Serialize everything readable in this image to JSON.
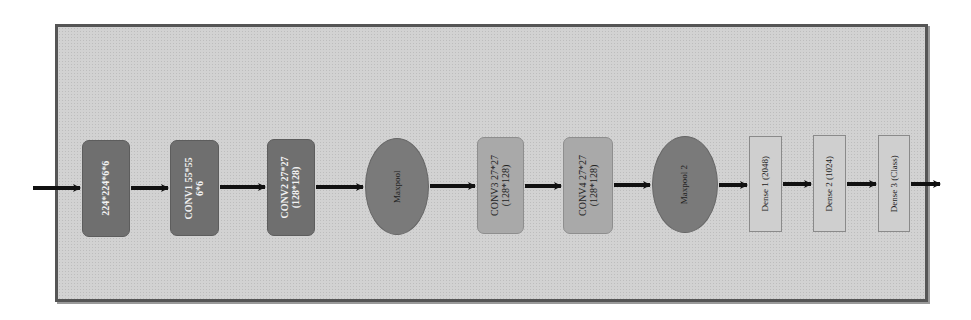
{
  "diagram": {
    "type": "cnn-architecture-flow",
    "nodes": [
      {
        "id": "input",
        "lines": [
          "224*224*6*6"
        ],
        "shape": "rounded-rect",
        "fill": "#6f6f6f"
      },
      {
        "id": "conv1",
        "lines": [
          "CONV1 55*55",
          "6*6"
        ],
        "shape": "rounded-rect",
        "fill": "#6f6f6f"
      },
      {
        "id": "conv2",
        "lines": [
          "CONV2 27*27",
          "(128*128)"
        ],
        "shape": "rounded-rect",
        "fill": "#6f6f6f"
      },
      {
        "id": "maxpool",
        "lines": [
          "Maxpool"
        ],
        "shape": "ellipse",
        "fill": "#7a7a7a"
      },
      {
        "id": "conv3",
        "lines": [
          "CONV3 27*27",
          "(128*128)"
        ],
        "shape": "rounded-rect",
        "fill": "#a9a9a9"
      },
      {
        "id": "conv4",
        "lines": [
          "CONV4 27*27",
          "(128*128)"
        ],
        "shape": "rounded-rect",
        "fill": "#a9a9a9"
      },
      {
        "id": "maxpool2",
        "lines": [
          "Maxpool 2"
        ],
        "shape": "ellipse",
        "fill": "#7a7a7a"
      },
      {
        "id": "dense1",
        "lines": [
          "Dense 1 (2048)"
        ],
        "shape": "rect",
        "fill": "#cfcfcf"
      },
      {
        "id": "dense2",
        "lines": [
          "Dense 2 (1024)"
        ],
        "shape": "rect",
        "fill": "#cfcfcf"
      },
      {
        "id": "dense3",
        "lines": [
          "Dense 3 (Class)"
        ],
        "shape": "rect",
        "fill": "#cfcfcf"
      }
    ],
    "edges": [
      [
        "external-input",
        "input"
      ],
      [
        "input",
        "conv1"
      ],
      [
        "conv1",
        "conv2"
      ],
      [
        "conv2",
        "maxpool"
      ],
      [
        "maxpool",
        "conv3"
      ],
      [
        "conv3",
        "conv4"
      ],
      [
        "conv4",
        "maxpool2"
      ],
      [
        "maxpool2",
        "dense1"
      ],
      [
        "dense1",
        "dense2"
      ],
      [
        "dense2",
        "dense3"
      ],
      [
        "dense3",
        "external-output"
      ]
    ],
    "colors": {
      "frame_fill": "#d2d2d2",
      "frame_border": "#555555",
      "arrow": "#111111"
    }
  }
}
